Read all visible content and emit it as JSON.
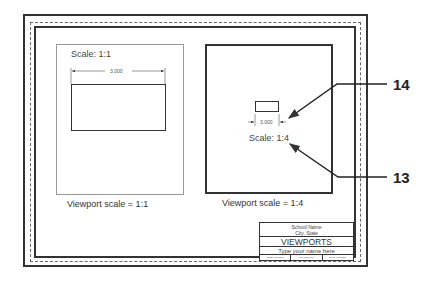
{
  "drawing": {
    "left_viewport": {
      "scale_text": "Scale: 1:1",
      "dimension_text": "3.000",
      "caption": "Viewport scale = 1:1"
    },
    "right_viewport": {
      "scale_text": "Scale: 1:4",
      "dimension_text": "3.000",
      "caption": "Viewport scale = 1:4"
    },
    "callouts": [
      {
        "number": "14"
      },
      {
        "number": "13"
      }
    ],
    "title_block": {
      "school_name": "School Name",
      "city_state": "City, State",
      "title": "VIEWPORTS",
      "name_placeholder": "Type your name here",
      "footer_cells": [
        "SUBMISSIONS",
        "SCALE:FULL",
        "DWG.FOLDER"
      ]
    },
    "colors": {
      "line": "#333333",
      "viewport_thin": "#999999",
      "background": "#ffffff"
    }
  }
}
